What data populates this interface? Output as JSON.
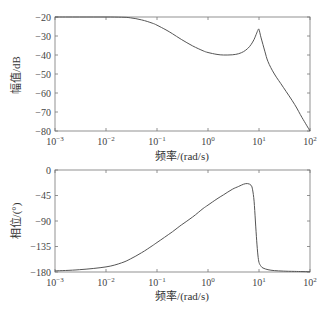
{
  "chart_data": [
    {
      "type": "line",
      "title": "",
      "xlabel": "频率/(rad/s)",
      "ylabel": "幅值/dB",
      "xscale": "log",
      "xlim": [
        0.001,
        100
      ],
      "ylim": [
        -80,
        -20
      ],
      "xticks": [
        0.001,
        0.01,
        0.1,
        1,
        10,
        100
      ],
      "xtick_labels": [
        "10^-3",
        "10^-2",
        "10^-1",
        "10^0",
        "10^1",
        "10^2"
      ],
      "yticks": [
        -20,
        -30,
        -40,
        -50,
        -60,
        -70,
        -80
      ],
      "ytick_labels": [
        "-20",
        "-30",
        "-40",
        "-50",
        "-60",
        "-70",
        "-80"
      ],
      "grid": false,
      "series": [
        {
          "name": "magnitude",
          "x": [
            0.001,
            0.003,
            0.01,
            0.02,
            0.03,
            0.05,
            0.08,
            0.1,
            0.15,
            0.2,
            0.3,
            0.5,
            0.8,
            1,
            1.5,
            2,
            3,
            4,
            5,
            6,
            7,
            8,
            9,
            9.5,
            10,
            11,
            13,
            15,
            20,
            30,
            50,
            70,
            100
          ],
          "values": [
            -20,
            -20,
            -20,
            -20.1,
            -20.4,
            -21.5,
            -23.2,
            -24.3,
            -26.8,
            -28.8,
            -31.8,
            -35.2,
            -37.8,
            -38.7,
            -39.7,
            -40,
            -39.9,
            -39.3,
            -38.2,
            -36.6,
            -34.5,
            -31.8,
            -28.5,
            -27,
            -26.5,
            -31,
            -38,
            -43.5,
            -50,
            -57,
            -66,
            -73,
            -80
          ]
        }
      ]
    },
    {
      "type": "line",
      "title": "",
      "xlabel": "频率/(rad/s)",
      "ylabel": "相位/(°)",
      "xscale": "log",
      "xlim": [
        0.001,
        100
      ],
      "ylim": [
        -180,
        0
      ],
      "xticks": [
        0.001,
        0.01,
        0.1,
        1,
        10,
        100
      ],
      "xtick_labels": [
        "10^-3",
        "10^-2",
        "10^-1",
        "10^0",
        "10^1",
        "10^2"
      ],
      "yticks": [
        0,
        -45,
        -90,
        -135,
        -180
      ],
      "ytick_labels": [
        "0",
        "-45",
        "-90",
        "-135",
        "-180"
      ],
      "grid": false,
      "series": [
        {
          "name": "phase",
          "x": [
            0.001,
            0.003,
            0.01,
            0.02,
            0.03,
            0.05,
            0.08,
            0.1,
            0.2,
            0.3,
            0.5,
            0.8,
            1,
            1.5,
            2,
            3,
            4,
            5,
            6,
            7,
            7.5,
            8,
            8.5,
            9,
            9.5,
            10,
            11,
            12,
            15,
            20,
            30,
            50,
            100
          ],
          "values": [
            -178,
            -176,
            -171,
            -164,
            -157,
            -146,
            -134,
            -128,
            -109,
            -97,
            -83,
            -68,
            -62,
            -51,
            -44,
            -34,
            -29,
            -25,
            -24,
            -27,
            -35,
            -55,
            -90,
            -125,
            -150,
            -163,
            -170,
            -173,
            -176,
            -177.5,
            -178.5,
            -179,
            -179.5
          ]
        }
      ]
    }
  ],
  "plots": {
    "magnitude": {
      "ylabel": "幅值/dB",
      "xlabel": "频率/(rad/s)",
      "yticks": [
        "-20",
        "-30",
        "-40",
        "-50",
        "-60",
        "-70",
        "-80"
      ]
    },
    "phase": {
      "ylabel": "相位/(°)",
      "xlabel": "频率/(rad/s)",
      "yticks": [
        "0",
        "-45",
        "-90",
        "-135",
        "-180"
      ]
    },
    "xtick_exponents": [
      "-3",
      "-2",
      "-1",
      "0",
      "1",
      "2"
    ]
  },
  "colors": {
    "line": "#555555",
    "axis": "#777777",
    "text": "#333333"
  }
}
